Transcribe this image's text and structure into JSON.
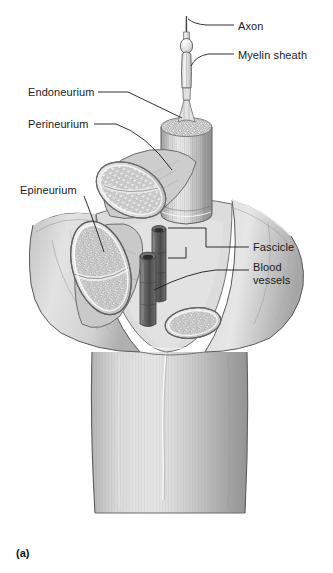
{
  "figure": {
    "panel_id": "(a)",
    "style": "grayscale pencil/airbrush anatomical illustration",
    "width": 333,
    "height": 573,
    "background_color": "#ffffff",
    "line_color": "#1a1a1a"
  },
  "labels": {
    "axon": "Axon",
    "myelin_sheath": "Myelin sheath",
    "endoneurium": "Endoneurium",
    "perineurium": "Perineurium",
    "epineurium": "Epineurium",
    "fascicle": "Fascicle",
    "blood_vessels_line1": "Blood",
    "blood_vessels_line2": "vessels"
  },
  "palette": {
    "paper": "#ffffff",
    "ink": "#1a1a1a",
    "sheath_light": "#e8e8e8",
    "sheath_mid": "#c9c9c9",
    "sheath_dark": "#9a9a9a",
    "fascicle_fill": "#d5d5d5",
    "fascicle_core": "#e2e2e2",
    "vessel_dark": "#5c5c5c",
    "vessel_darker": "#3f3f3f",
    "trunk_light": "#dedede",
    "trunk_mid": "#bdbdbd",
    "trunk_dark": "#8f8f8f"
  },
  "structures": [
    {
      "name": "axon",
      "description": "thin fiber extending upward from the myelinated segment"
    },
    {
      "name": "myelin-sheath",
      "description": "elongated bulbous sleeve with node of Ranvier around the axon"
    },
    {
      "name": "endoneurium",
      "description": "delicate connective tissue surrounding individual nerve fibers inside a fascicle"
    },
    {
      "name": "perineurium",
      "description": "sheath wrapping each fascicle bundle"
    },
    {
      "name": "epineurium",
      "description": "outermost flared connective tissue sheath of the whole nerve"
    },
    {
      "name": "main-fascicle",
      "description": "large upright cylindrical bundle of parallel nerve fibers with honeycomb cut face"
    },
    {
      "name": "fascicle-cross-section-upper-left",
      "description": "cut oval fascicle showing stippled endoneurium"
    },
    {
      "name": "fascicle-cross-section-lower-left",
      "description": "large cut oval fascicle showing stippled endoneurium"
    },
    {
      "name": "fascicle-cross-section-right",
      "description": "small cut oval fascicle at lower right"
    },
    {
      "name": "blood-vessels",
      "description": "two dark hollow tubes running along the nerve"
    },
    {
      "name": "nerve-trunk",
      "description": "intact cylindrical nerve trunk continuing downward"
    }
  ],
  "leaders": {
    "axon": "horizontal line from label left to axon tip",
    "myelin_sheath": "line from label left down to myelin segment",
    "endoneurium": "long line from label right down to fascicle base",
    "perineurium": "line from label right down to fascicle sheath",
    "epineurium": "curved line from label down to outer sheath surface",
    "fascicle": "bracketed leader with two branches pointing to fascicle wall",
    "blood_vessels": "line from label left down to vessel tubes"
  }
}
